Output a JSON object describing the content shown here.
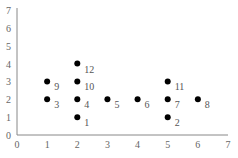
{
  "chart_data": {
    "type": "scatter",
    "title": "",
    "xlabel": "",
    "ylabel": "",
    "xlim": [
      0,
      7
    ],
    "ylim": [
      0,
      7
    ],
    "xticks": [
      0,
      1,
      2,
      3,
      4,
      5,
      6,
      7
    ],
    "yticks": [
      0,
      1,
      2,
      3,
      4,
      5,
      6,
      7
    ],
    "grid": false,
    "points": [
      {
        "label": "1",
        "x": 2,
        "y": 1
      },
      {
        "label": "2",
        "x": 5,
        "y": 1
      },
      {
        "label": "3",
        "x": 1,
        "y": 2
      },
      {
        "label": "4",
        "x": 2,
        "y": 2
      },
      {
        "label": "5",
        "x": 3,
        "y": 2
      },
      {
        "label": "6",
        "x": 4,
        "y": 2
      },
      {
        "label": "7",
        "x": 5,
        "y": 2
      },
      {
        "label": "8",
        "x": 6,
        "y": 2
      },
      {
        "label": "9",
        "x": 1,
        "y": 3
      },
      {
        "label": "10",
        "x": 2,
        "y": 3
      },
      {
        "label": "11",
        "x": 5,
        "y": 3
      },
      {
        "label": "12",
        "x": 2,
        "y": 4
      }
    ]
  }
}
